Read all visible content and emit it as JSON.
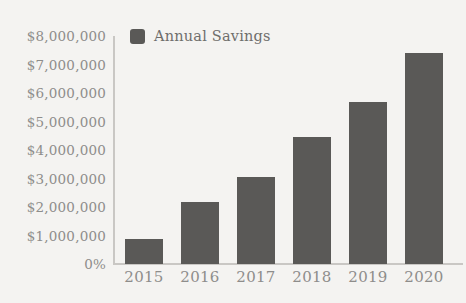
{
  "chart_data": {
    "type": "bar",
    "title": "",
    "subtitle": "",
    "xlabel": "",
    "ylabel": "",
    "categories": [
      "2015",
      "2016",
      "2017",
      "2018",
      "2019",
      "2020"
    ],
    "series": [
      {
        "name": "Annual Savings",
        "color": "#5a5957",
        "values": [
          880000,
          2160000,
          3050000,
          4450000,
          5700000,
          7400000
        ]
      }
    ],
    "ylim": [
      0,
      8000000
    ],
    "y_ticks": [
      {
        "value": 8000000,
        "label": "$8,000,000"
      },
      {
        "value": 7000000,
        "label": "$7,000,000"
      },
      {
        "value": 6000000,
        "label": "$6,000,000"
      },
      {
        "value": 5000000,
        "label": "$5,000,000"
      },
      {
        "value": 4000000,
        "label": "$4,000,000"
      },
      {
        "value": 3000000,
        "label": "$3,000,000"
      },
      {
        "value": 2000000,
        "label": "$2,000,000"
      },
      {
        "value": 1000000,
        "label": "$1,000,000"
      },
      {
        "value": 0,
        "label": "0%"
      }
    ],
    "grid": false,
    "legend_position": "top-left",
    "legend": [
      {
        "label": "Annual Savings",
        "color": "#5a5957"
      }
    ],
    "annotations": []
  },
  "style": {
    "background_color": "#f4f3f1",
    "axis_color": "#c9c7c4",
    "tick_label_color": "#8e8d8b",
    "legend_label_color": "#6f6e6c",
    "bar_color": "#5a5957"
  }
}
